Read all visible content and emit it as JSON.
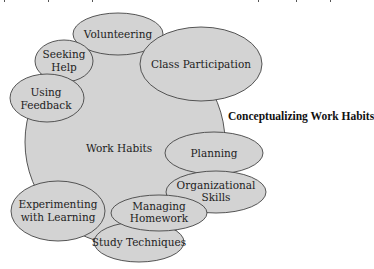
{
  "diagram": {
    "title": "Conceptualizing Work Habits",
    "center": {
      "label": "Work Habits",
      "cx": 125,
      "cy": 142,
      "rx": 100,
      "ry": 103
    },
    "nodes": [
      {
        "id": "volunteering",
        "lines": [
          "Volunteering"
        ],
        "cx": 118,
        "cy": 34,
        "rx": 45,
        "ry": 21
      },
      {
        "id": "class-participation",
        "lines": [
          "Class Participation"
        ],
        "cx": 201,
        "cy": 64,
        "rx": 61,
        "ry": 37
      },
      {
        "id": "seeking-help",
        "lines": [
          "Seeking",
          "Help"
        ],
        "cx": 64,
        "cy": 61,
        "rx": 29,
        "ry": 21
      },
      {
        "id": "using-feedback",
        "lines": [
          "Using",
          "Feedback"
        ],
        "cx": 47,
        "cy": 98,
        "rx": 37,
        "ry": 24
      },
      {
        "id": "planning",
        "lines": [
          "Planning"
        ],
        "cx": 214,
        "cy": 153,
        "rx": 49,
        "ry": 21
      },
      {
        "id": "organizational-skills",
        "lines": [
          "Organizational",
          "Skills"
        ],
        "cx": 216,
        "cy": 192,
        "rx": 50,
        "ry": 21
      },
      {
        "id": "experimenting-with-learning",
        "lines": [
          "Experimenting",
          "with Learning"
        ],
        "cx": 58,
        "cy": 211,
        "rx": 47,
        "ry": 30
      },
      {
        "id": "study-techniques",
        "lines": [
          "Study Techniques"
        ],
        "cx": 139,
        "cy": 242,
        "rx": 45,
        "ry": 20
      },
      {
        "id": "managing-homework",
        "lines": [
          "Managing",
          "Homework"
        ],
        "cx": 159,
        "cy": 213,
        "rx": 48,
        "ry": 18
      }
    ],
    "colors": {
      "fill": "#d3d3d3",
      "stroke": "#444444",
      "text": "#222222"
    }
  }
}
